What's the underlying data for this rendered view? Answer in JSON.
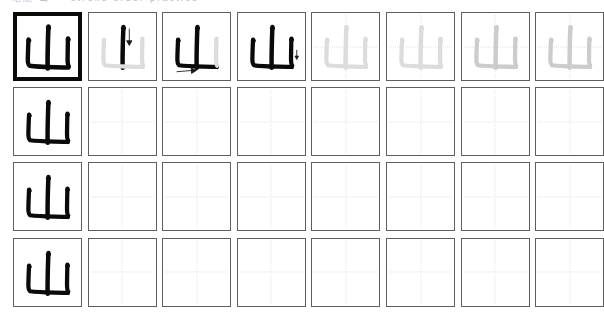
{
  "worksheet": {
    "header_text": "笔順 山 ・ stroke order practice",
    "character": "山",
    "character_meaning": "mountain",
    "total_strokes": 3,
    "columns": 8,
    "rows": 4,
    "colors": {
      "ink": "#0a0a0a",
      "cell_border": "#5e5e5e",
      "cell_border_emphasis": "#0a0a0a",
      "guide_line": "#e2e2e6",
      "trace_light": "#dcdcdc",
      "trace_medium": "#cccccc",
      "background": "#ffffff"
    },
    "rows_data": [
      {
        "row_label": "stroke-order-row",
        "cells": [
          {
            "kind": "model",
            "border": "thick",
            "ink": "full",
            "strokes": 3,
            "guide": false,
            "arrow": "none"
          },
          {
            "kind": "step",
            "border": "thin",
            "ink": "step",
            "strokes": 1,
            "guide": false,
            "arrow": "down"
          },
          {
            "kind": "step",
            "border": "thin",
            "ink": "step",
            "strokes": 2,
            "guide": false,
            "arrow": "right"
          },
          {
            "kind": "step",
            "border": "thin",
            "ink": "step",
            "strokes": 3,
            "guide": false,
            "arrow": "tick"
          },
          {
            "kind": "trace",
            "border": "thin",
            "ink": "light",
            "strokes": 3,
            "guide": true,
            "arrow": "none"
          },
          {
            "kind": "trace",
            "border": "thin",
            "ink": "light",
            "strokes": 3,
            "guide": true,
            "arrow": "none"
          },
          {
            "kind": "trace",
            "border": "thin",
            "ink": "medium",
            "strokes": 3,
            "guide": true,
            "arrow": "none"
          },
          {
            "kind": "trace",
            "border": "thin",
            "ink": "medium",
            "strokes": 3,
            "guide": true,
            "arrow": "none"
          }
        ]
      },
      {
        "row_label": "practice-row-1",
        "cells": [
          {
            "kind": "model",
            "border": "thin",
            "ink": "full",
            "strokes": 3,
            "guide": false,
            "arrow": "none"
          },
          {
            "kind": "blank",
            "border": "thin",
            "ink": "none",
            "strokes": 0,
            "guide": true,
            "arrow": "none"
          },
          {
            "kind": "blank",
            "border": "thin",
            "ink": "none",
            "strokes": 0,
            "guide": true,
            "arrow": "none"
          },
          {
            "kind": "blank",
            "border": "thin",
            "ink": "none",
            "strokes": 0,
            "guide": true,
            "arrow": "none"
          },
          {
            "kind": "blank",
            "border": "thin",
            "ink": "none",
            "strokes": 0,
            "guide": true,
            "arrow": "none"
          },
          {
            "kind": "blank",
            "border": "thin",
            "ink": "none",
            "strokes": 0,
            "guide": true,
            "arrow": "none"
          },
          {
            "kind": "blank",
            "border": "thin",
            "ink": "none",
            "strokes": 0,
            "guide": true,
            "arrow": "none"
          },
          {
            "kind": "blank",
            "border": "thin",
            "ink": "none",
            "strokes": 0,
            "guide": true,
            "arrow": "none"
          }
        ]
      },
      {
        "row_label": "practice-row-2",
        "cells": [
          {
            "kind": "model",
            "border": "thin",
            "ink": "full",
            "strokes": 3,
            "guide": false,
            "arrow": "none"
          },
          {
            "kind": "blank",
            "border": "thin",
            "ink": "none",
            "strokes": 0,
            "guide": true,
            "arrow": "none"
          },
          {
            "kind": "blank",
            "border": "thin",
            "ink": "none",
            "strokes": 0,
            "guide": true,
            "arrow": "none"
          },
          {
            "kind": "blank",
            "border": "thin",
            "ink": "none",
            "strokes": 0,
            "guide": true,
            "arrow": "none"
          },
          {
            "kind": "blank",
            "border": "thin",
            "ink": "none",
            "strokes": 0,
            "guide": true,
            "arrow": "none"
          },
          {
            "kind": "blank",
            "border": "thin",
            "ink": "none",
            "strokes": 0,
            "guide": true,
            "arrow": "none"
          },
          {
            "kind": "blank",
            "border": "thin",
            "ink": "none",
            "strokes": 0,
            "guide": true,
            "arrow": "none"
          },
          {
            "kind": "blank",
            "border": "thin",
            "ink": "none",
            "strokes": 0,
            "guide": true,
            "arrow": "none"
          }
        ]
      },
      {
        "row_label": "practice-row-3",
        "cells": [
          {
            "kind": "model",
            "border": "thin",
            "ink": "full",
            "strokes": 3,
            "guide": false,
            "arrow": "none"
          },
          {
            "kind": "blank",
            "border": "thin",
            "ink": "none",
            "strokes": 0,
            "guide": true,
            "arrow": "none"
          },
          {
            "kind": "blank",
            "border": "thin",
            "ink": "none",
            "strokes": 0,
            "guide": true,
            "arrow": "none"
          },
          {
            "kind": "blank",
            "border": "thin",
            "ink": "none",
            "strokes": 0,
            "guide": true,
            "arrow": "none"
          },
          {
            "kind": "blank",
            "border": "thin",
            "ink": "none",
            "strokes": 0,
            "guide": true,
            "arrow": "none"
          },
          {
            "kind": "blank",
            "border": "thin",
            "ink": "none",
            "strokes": 0,
            "guide": true,
            "arrow": "none"
          },
          {
            "kind": "blank",
            "border": "thin",
            "ink": "none",
            "strokes": 0,
            "guide": true,
            "arrow": "none"
          },
          {
            "kind": "blank",
            "border": "thin",
            "ink": "none",
            "strokes": 0,
            "guide": true,
            "arrow": "none"
          }
        ]
      }
    ],
    "layout": {
      "origin_x": 13,
      "origin_y": 3,
      "col_pitch": 74.6,
      "row_pitch": 75.2
    },
    "stroke_paths": [
      "M 35.5 14.5 C 35.0 22.0 34.8 33.0 34.6 45.0 C 34.55 50.5 34.6 54.0 34.7 56.5",
      "M 15.5 27.5 C 15.2 33.0 15.0 40.0 14.8 46.5 C 14.7 50.5 15.2 52.8 16.6 53.8 C 22.0 54.6 32.0 55.0 42.0 55.2 C 48.5 55.3 53.0 55.4 55.5 55.6",
      "M 55.0 26.5 C 54.8 32.0 54.7 39.5 54.6 46.5 C 54.55 50.5 54.9 53.0 55.8 54.2"
    ],
    "stroke_widths": [
      4.6,
      4.4,
      4.4
    ],
    "stroke_head_caps": [
      {
        "cx": 35.4,
        "cy": 15.8,
        "rx": 2.6,
        "ry": 2.4,
        "rot": -18
      },
      {
        "cx": 15.8,
        "cy": 28.6,
        "rx": 2.5,
        "ry": 2.3,
        "rot": -18
      },
      {
        "cx": 55.2,
        "cy": 27.6,
        "rx": 2.5,
        "ry": 2.3,
        "rot": -18
      }
    ]
  }
}
